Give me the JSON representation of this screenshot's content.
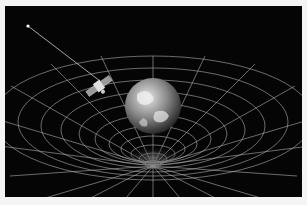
{
  "image": {
    "description": "Artist illustration: satellite orbiting Earth above a curved spacetime grid funnel, with a light beam to a distant star",
    "colors": {
      "background": "#050505",
      "border": "#f4f4f4",
      "grid": "#d8d8d8",
      "earth_ocean": "#3a3a3a",
      "earth_cloud": "#e8e8e8"
    }
  }
}
